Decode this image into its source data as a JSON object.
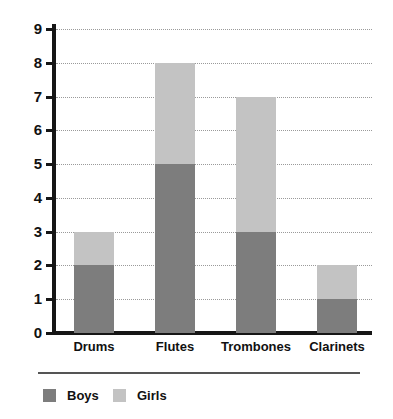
{
  "chart_data": {
    "type": "bar",
    "subtype": "stacked-vertical",
    "title": "",
    "xlabel": "",
    "ylabel": "",
    "categories": [
      "Drums",
      "Flutes",
      "Trombones",
      "Clarinets"
    ],
    "series": [
      {
        "name": "Boys",
        "color": "#7d7d7d",
        "values": [
          2,
          5,
          3,
          1
        ]
      },
      {
        "name": "Girls",
        "color": "#c3c3c3",
        "values": [
          1,
          3,
          4,
          1
        ]
      }
    ],
    "totals": [
      3,
      8,
      7,
      2
    ],
    "ylim": [
      0,
      9
    ],
    "ytick_step": 1,
    "yticks": [
      "9",
      "8",
      "7",
      "6",
      "5",
      "4",
      "3",
      "2",
      "1",
      "0"
    ],
    "grid": true,
    "grid_style": "dotted-horizontal",
    "legend_position": "bottom-left",
    "legend_entries": [
      "Boys",
      "Girls"
    ],
    "axis_color": "#161616",
    "background": "#ffffff"
  },
  "axis": {
    "y_ticks": [
      {
        "label": "9",
        "value": 9
      },
      {
        "label": "8",
        "value": 8
      },
      {
        "label": "7",
        "value": 7
      },
      {
        "label": "6",
        "value": 6
      },
      {
        "label": "5",
        "value": 5
      },
      {
        "label": "4",
        "value": 4
      },
      {
        "label": "3",
        "value": 3
      },
      {
        "label": "2",
        "value": 2
      },
      {
        "label": "1",
        "value": 1
      },
      {
        "label": "0",
        "value": 0
      }
    ],
    "x_ticks": [
      {
        "label": "Drums"
      },
      {
        "label": "Flutes"
      },
      {
        "label": "Trombones"
      },
      {
        "label": "Clarinets"
      }
    ]
  },
  "legend": {
    "items": [
      {
        "label": "Boys",
        "color": "#7d7d7d"
      },
      {
        "label": "Girls",
        "color": "#c3c3c3"
      }
    ]
  }
}
